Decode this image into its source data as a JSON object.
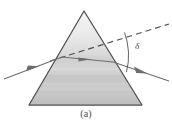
{
  "figure": {
    "caption": "(a)",
    "background_color": "#ffffff",
    "prism": {
      "shape": "triangle",
      "apex": {
        "x": 84,
        "y": 11
      },
      "bottom_left": {
        "x": 29,
        "y": 105
      },
      "bottom_right": {
        "x": 142,
        "y": 105
      },
      "outline_color": "#4f4f4f",
      "fill_top_color": "#efefef",
      "fill_bottom_color": "#b9b9b9"
    },
    "rays": {
      "incident": {
        "label": "incident-ray",
        "from": {
          "x": 4,
          "y": 79
        },
        "to": {
          "x": 62,
          "y": 57
        },
        "color": "#6e6e6e",
        "arrow_at": {
          "x": 33,
          "y": 68
        }
      },
      "internal": {
        "label": "internal-ray",
        "from": {
          "x": 62,
          "y": 57
        },
        "to": {
          "x": 113,
          "y": 62
        },
        "color": "#6e6e6e",
        "arrow_at": {
          "x": 86,
          "y": 59
        }
      },
      "emergent": {
        "label": "emergent-ray",
        "from": {
          "x": 113,
          "y": 62
        },
        "to": {
          "x": 169,
          "y": 81
        },
        "color": "#6e6e6e",
        "arrow_at": {
          "x": 142,
          "y": 72
        }
      },
      "extension_dashed": {
        "label": "undeviated-direction-dashed",
        "from": {
          "x": 50,
          "y": 61
        },
        "to": {
          "x": 169,
          "y": 24
        },
        "color": "#4f4f4f",
        "dash_pattern": "6 4"
      }
    },
    "angle": {
      "symbol": "δ",
      "name": "angle-of-deviation",
      "label_position": {
        "x": 137,
        "y": 48
      },
      "arc_from": {
        "x": 124,
        "y": 32
      },
      "arc_to": {
        "x": 126,
        "y": 72
      },
      "arc_color": "#5a5a5a"
    }
  }
}
